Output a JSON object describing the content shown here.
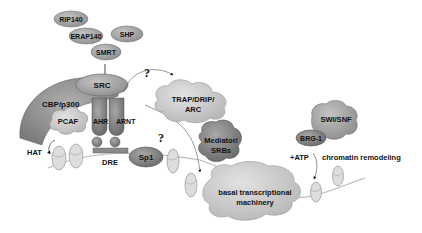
{
  "diagram": {
    "corepressors": [
      {
        "label": "RIP140"
      },
      {
        "label": "ERAP140"
      },
      {
        "label": "SHP"
      },
      {
        "label": "SMRT"
      }
    ],
    "coactivator_complex": {
      "src": "SRC",
      "cbp": "CBP/p300",
      "pcaf": "PCAF",
      "ahr": "AHR",
      "arnt": "ARNT",
      "dre": "DRE",
      "hat": "HAT"
    },
    "sp1": "Sp1",
    "trap": {
      "line1": "TRAP/DRIP/",
      "line2": "ARC"
    },
    "mediator": {
      "line1": "Mediator/",
      "line2": "SRBs"
    },
    "btm": {
      "line1": "basal transcriptional",
      "line2": "machinery"
    },
    "swi": {
      "label": "SWI/SNF",
      "brg": "BRG-1"
    },
    "atp": "+ATP",
    "remodel": "chromatin remodeling",
    "question_mark": "?"
  }
}
